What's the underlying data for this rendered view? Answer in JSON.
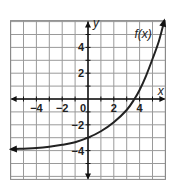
{
  "chart_data": {
    "type": "line",
    "title": "",
    "xlabel": "x",
    "ylabel": "y",
    "xlim": [
      -6,
      6
    ],
    "ylim": [
      -6,
      6
    ],
    "grid": true,
    "grid_step": 1,
    "x_ticks": [
      -4,
      -2,
      0,
      2,
      4
    ],
    "y_ticks": [
      4,
      2,
      -2,
      -4
    ],
    "x_tick_labels": [
      "−4",
      "−2",
      "0",
      "2",
      "4"
    ],
    "y_tick_labels": [
      "4",
      "2",
      "−2",
      "−4"
    ],
    "annotations": [
      {
        "text": "f(x)",
        "x": 4.3,
        "y": 4.7
      }
    ],
    "series": [
      {
        "name": "f(x)",
        "color": "#222222",
        "asymptote_y": -4,
        "arrow_left": true,
        "arrow_right": true,
        "x": [
          -5.9,
          -5,
          -4,
          -3,
          -2,
          -1,
          0,
          1,
          2,
          3,
          3.6,
          4,
          4.5,
          5,
          5.5,
          5.9
        ],
        "y": [
          -3.9,
          -3.85,
          -3.8,
          -3.7,
          -3.55,
          -3.35,
          -3.0,
          -2.5,
          -1.8,
          -0.85,
          0,
          0.7,
          1.8,
          3.1,
          4.5,
          6.0
        ]
      }
    ]
  }
}
